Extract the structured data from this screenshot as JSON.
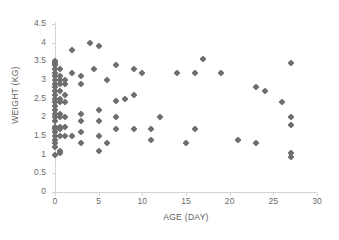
{
  "chart_data": {
    "type": "scatter",
    "title": "",
    "xlabel": "AGE (DAY)",
    "ylabel": "WEIGHT (KG)",
    "xlim": [
      0,
      30
    ],
    "ylim": [
      0,
      4.5
    ],
    "xticks": [
      0,
      5,
      10,
      15,
      20,
      25,
      30
    ],
    "xtick_labels": [
      "0",
      "5",
      "10",
      "15",
      "20",
      "25",
      "30"
    ],
    "yticks": [
      0,
      0.5,
      1,
      1.5,
      2,
      2.5,
      3,
      3.5,
      4,
      4.5
    ],
    "ytick_labels": [
      "0",
      "0.5",
      "1",
      "1.5",
      "2",
      "2.5",
      "3",
      "3.5",
      "4",
      "4.5"
    ],
    "grid": false,
    "legend": false,
    "marker": "diamond",
    "marker_color": "#6e6e6e",
    "series": [
      {
        "name": "weight vs age",
        "points": [
          [
            0,
            1.0
          ],
          [
            0,
            1.2
          ],
          [
            0,
            1.3
          ],
          [
            0,
            1.4
          ],
          [
            0,
            1.5
          ],
          [
            0,
            1.6
          ],
          [
            0,
            1.7
          ],
          [
            0,
            1.75
          ],
          [
            0,
            1.9
          ],
          [
            0,
            2.0
          ],
          [
            0,
            2.1
          ],
          [
            0,
            2.2
          ],
          [
            0,
            2.3
          ],
          [
            0,
            2.4
          ],
          [
            0,
            2.5
          ],
          [
            0,
            2.6
          ],
          [
            0,
            2.7
          ],
          [
            0,
            2.8
          ],
          [
            0,
            2.9
          ],
          [
            0,
            3.0
          ],
          [
            0,
            3.1
          ],
          [
            0,
            3.2
          ],
          [
            0,
            3.3
          ],
          [
            0,
            3.4
          ],
          [
            0,
            3.45
          ],
          [
            0,
            3.5
          ],
          [
            0.6,
            1.05
          ],
          [
            0.6,
            1.1
          ],
          [
            0.6,
            1.5
          ],
          [
            0.6,
            1.7
          ],
          [
            0.6,
            1.75
          ],
          [
            0.6,
            2.0
          ],
          [
            0.6,
            2.1
          ],
          [
            0.6,
            2.4
          ],
          [
            0.6,
            2.5
          ],
          [
            0.6,
            2.7
          ],
          [
            0.6,
            2.9
          ],
          [
            0.6,
            3.0
          ],
          [
            0.6,
            3.1
          ],
          [
            0.6,
            3.3
          ],
          [
            1.2,
            1.5
          ],
          [
            1.2,
            1.75
          ],
          [
            1.2,
            2.0
          ],
          [
            1.2,
            2.4
          ],
          [
            1.2,
            2.6
          ],
          [
            1.2,
            2.9
          ],
          [
            1.2,
            3.0
          ],
          [
            2,
            1.5
          ],
          [
            2,
            3.2
          ],
          [
            2,
            3.8
          ],
          [
            3,
            1.3
          ],
          [
            3,
            1.6
          ],
          [
            3,
            1.9
          ],
          [
            3,
            2.1
          ],
          [
            3,
            2.9
          ],
          [
            3,
            3.1
          ],
          [
            4,
            4.0
          ],
          [
            4.5,
            3.3
          ],
          [
            5,
            1.1
          ],
          [
            5,
            1.5
          ],
          [
            5,
            1.9
          ],
          [
            5,
            2.2
          ],
          [
            5,
            3.9
          ],
          [
            6,
            1.3
          ],
          [
            6,
            3.0
          ],
          [
            7,
            1.7
          ],
          [
            7,
            2.0
          ],
          [
            7,
            2.45
          ],
          [
            7,
            3.4
          ],
          [
            8,
            2.5
          ],
          [
            9,
            1.7
          ],
          [
            9,
            2.6
          ],
          [
            9,
            3.3
          ],
          [
            10,
            3.2
          ],
          [
            11,
            1.4
          ],
          [
            11,
            1.7
          ],
          [
            12,
            2.0
          ],
          [
            14,
            3.2
          ],
          [
            15,
            1.3
          ],
          [
            16,
            1.7
          ],
          [
            16,
            3.2
          ],
          [
            17,
            3.55
          ],
          [
            19,
            3.2
          ],
          [
            21,
            1.4
          ],
          [
            23,
            1.3
          ],
          [
            23,
            2.8
          ],
          [
            24,
            2.7
          ],
          [
            26,
            2.4
          ],
          [
            27,
            0.95
          ],
          [
            27,
            1.05
          ],
          [
            27,
            1.8
          ],
          [
            27,
            2.0
          ],
          [
            27,
            3.45
          ]
        ]
      }
    ]
  }
}
